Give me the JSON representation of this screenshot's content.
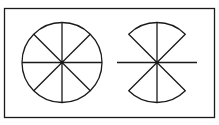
{
  "figure": {
    "stroke_color": "#1a1a1a",
    "background_color": "#ffffff",
    "left_figure": {
      "name": "circle divided into 8 equal sectors",
      "divisions": 8
    },
    "right_figure": {
      "name": "two opposite 90-degree sectors with cross lines",
      "sector_angle_degrees": 90,
      "sector_count": 2,
      "orientation": "top-and-bottom"
    }
  }
}
